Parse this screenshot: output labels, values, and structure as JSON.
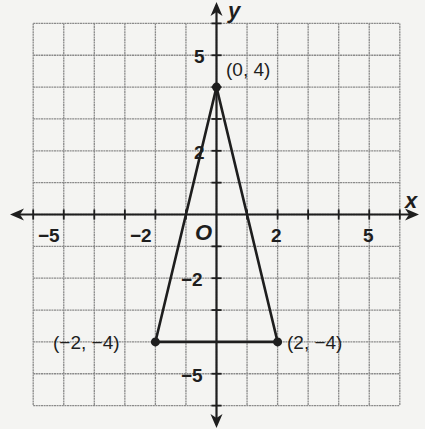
{
  "figure": {
    "type": "coordinate-plane",
    "x_range": [
      -6,
      6
    ],
    "y_range": [
      -6,
      6
    ],
    "axis_labels": {
      "x": "x",
      "y": "y"
    },
    "origin_label": "O",
    "x_tick_labels": [
      {
        "value": -5,
        "text": "−5"
      },
      {
        "value": -2,
        "text": "−2"
      },
      {
        "value": 2,
        "text": "2"
      },
      {
        "value": 5,
        "text": "5"
      }
    ],
    "y_tick_labels": [
      {
        "value": 5,
        "text": "5"
      },
      {
        "value": 2,
        "text": "2"
      },
      {
        "value": -2,
        "text": "−2"
      },
      {
        "value": -5,
        "text": "−5"
      }
    ],
    "points": [
      {
        "x": 0,
        "y": 4,
        "label": "(0, 4)"
      },
      {
        "x": -2,
        "y": -4,
        "label": "(−2, −4)"
      },
      {
        "x": 2,
        "y": -4,
        "label": "(2, −4)"
      }
    ],
    "shape": "triangle",
    "colors": {
      "grid": "#8a8a8a",
      "axes": "#1e1e1e",
      "background": "#f4f4f2",
      "lines": "#1e1e1e"
    }
  }
}
